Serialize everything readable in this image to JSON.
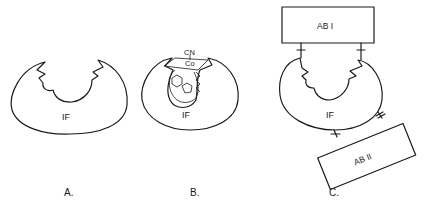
{
  "panels": [
    {
      "id": "A",
      "caption": "A.",
      "protein_label": "IF"
    },
    {
      "id": "B",
      "caption": "B.",
      "protein_label": "IF",
      "ligand_labels": [
        "CN",
        "Co"
      ]
    },
    {
      "id": "C",
      "caption": "C.",
      "protein_label": "IF",
      "antibody_labels": [
        "AB I",
        "AB II"
      ]
    }
  ]
}
